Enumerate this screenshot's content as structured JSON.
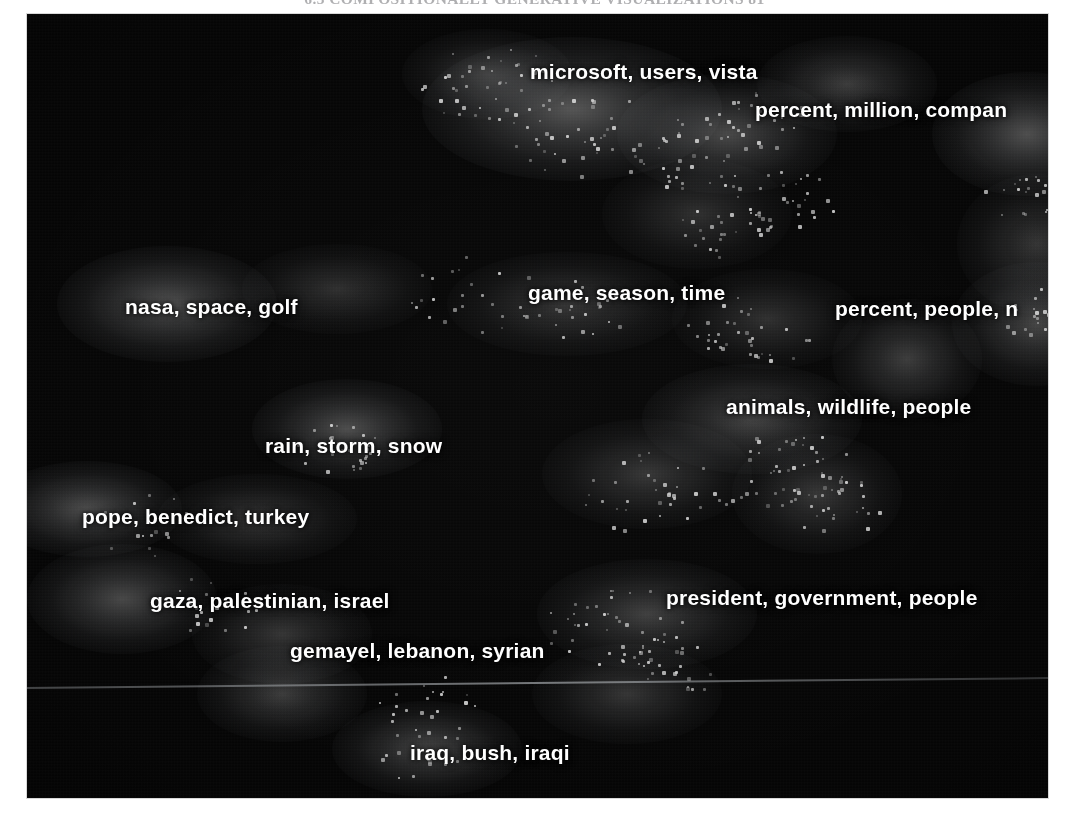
{
  "page": {
    "running_head": "6.3  COMPOSITIONALLY GENERATIVE VISUALIZATIONS     81"
  },
  "figure": {
    "name": "topic-density-map",
    "background_color": "#050505",
    "label_color": "#ffffff",
    "point_color": "#cfcfcf"
  },
  "chart_data": {
    "type": "scatter",
    "title": "",
    "xlabel": "",
    "ylabel": "",
    "grid": false,
    "legend": "none",
    "background": "#050505",
    "xlim": [
      0,
      1021
    ],
    "ylim": [
      0,
      784
    ],
    "labels": [
      {
        "text": "microsoft, users, vista",
        "x": 503,
        "y": 46,
        "align": "left"
      },
      {
        "text": "percent, million, compan",
        "x": 728,
        "y": 84,
        "align": "left",
        "clipped": true
      },
      {
        "text": "nasa, space, golf",
        "x": 98,
        "y": 281,
        "align": "left"
      },
      {
        "text": "game, season, time",
        "x": 501,
        "y": 267,
        "align": "left"
      },
      {
        "text": "percent, people, n",
        "x": 808,
        "y": 283,
        "align": "left",
        "clipped": true
      },
      {
        "text": "animals, wildlife, people",
        "x": 699,
        "y": 381,
        "align": "left"
      },
      {
        "text": "rain, storm, snow",
        "x": 238,
        "y": 420,
        "align": "left"
      },
      {
        "text": "pope, benedict, turkey",
        "x": 55,
        "y": 491,
        "align": "left"
      },
      {
        "text": "gaza, palestinian, israel",
        "x": 123,
        "y": 575,
        "align": "left"
      },
      {
        "text": "president, government, people",
        "x": 639,
        "y": 572,
        "align": "left"
      },
      {
        "text": "gemayel, lebanon, syrian",
        "x": 263,
        "y": 625,
        "align": "left"
      },
      {
        "text": "iraq, bush, iraqi",
        "x": 383,
        "y": 727,
        "align": "left"
      }
    ],
    "density_blobs": [
      {
        "cx": 545,
        "cy": 95,
        "rx": 150,
        "ry": 72,
        "intensity": 0.5
      },
      {
        "cx": 700,
        "cy": 120,
        "rx": 110,
        "ry": 60,
        "intensity": 0.42
      },
      {
        "cx": 820,
        "cy": 70,
        "rx": 90,
        "ry": 48,
        "intensity": 0.34
      },
      {
        "cx": 1000,
        "cy": 120,
        "rx": 95,
        "ry": 62,
        "intensity": 0.46
      },
      {
        "cx": 460,
        "cy": 60,
        "rx": 85,
        "ry": 45,
        "intensity": 0.3
      },
      {
        "cx": 670,
        "cy": 200,
        "rx": 95,
        "ry": 55,
        "intensity": 0.26
      },
      {
        "cx": 1010,
        "cy": 230,
        "rx": 80,
        "ry": 70,
        "intensity": 0.3
      },
      {
        "cx": 140,
        "cy": 290,
        "rx": 110,
        "ry": 58,
        "intensity": 0.46
      },
      {
        "cx": 310,
        "cy": 275,
        "rx": 95,
        "ry": 45,
        "intensity": 0.26
      },
      {
        "cx": 540,
        "cy": 290,
        "rx": 120,
        "ry": 52,
        "intensity": 0.3
      },
      {
        "cx": 740,
        "cy": 305,
        "rx": 95,
        "ry": 50,
        "intensity": 0.26
      },
      {
        "cx": 880,
        "cy": 345,
        "rx": 75,
        "ry": 60,
        "intensity": 0.34
      },
      {
        "cx": 1010,
        "cy": 310,
        "rx": 85,
        "ry": 62,
        "intensity": 0.4
      },
      {
        "cx": 320,
        "cy": 415,
        "rx": 95,
        "ry": 50,
        "intensity": 0.44
      },
      {
        "cx": 725,
        "cy": 405,
        "rx": 110,
        "ry": 55,
        "intensity": 0.38
      },
      {
        "cx": 620,
        "cy": 460,
        "rx": 105,
        "ry": 55,
        "intensity": 0.3
      },
      {
        "cx": 790,
        "cy": 480,
        "rx": 85,
        "ry": 60,
        "intensity": 0.3
      },
      {
        "cx": 60,
        "cy": 495,
        "rx": 95,
        "ry": 48,
        "intensity": 0.44
      },
      {
        "cx": 230,
        "cy": 505,
        "rx": 100,
        "ry": 45,
        "intensity": 0.3
      },
      {
        "cx": 95,
        "cy": 585,
        "rx": 95,
        "ry": 55,
        "intensity": 0.42
      },
      {
        "cx": 255,
        "cy": 620,
        "rx": 90,
        "ry": 50,
        "intensity": 0.3
      },
      {
        "cx": 620,
        "cy": 600,
        "rx": 110,
        "ry": 55,
        "intensity": 0.36
      },
      {
        "cx": 255,
        "cy": 680,
        "rx": 85,
        "ry": 48,
        "intensity": 0.34
      },
      {
        "cx": 600,
        "cy": 680,
        "rx": 95,
        "ry": 50,
        "intensity": 0.3
      },
      {
        "cx": 400,
        "cy": 735,
        "rx": 95,
        "ry": 48,
        "intensity": 0.4
      }
    ],
    "point_clusters": [
      {
        "cx": 460,
        "cy": 70,
        "n": 46,
        "spread": 58
      },
      {
        "cx": 560,
        "cy": 120,
        "n": 40,
        "spread": 62
      },
      {
        "cx": 670,
        "cy": 140,
        "n": 34,
        "spread": 52
      },
      {
        "cx": 730,
        "cy": 105,
        "n": 26,
        "spread": 40
      },
      {
        "cx": 760,
        "cy": 185,
        "n": 30,
        "spread": 46
      },
      {
        "cx": 695,
        "cy": 215,
        "n": 24,
        "spread": 40
      },
      {
        "cx": 718,
        "cy": 320,
        "n": 34,
        "spread": 52
      },
      {
        "cx": 760,
        "cy": 455,
        "n": 38,
        "spread": 54
      },
      {
        "cx": 805,
        "cy": 490,
        "n": 30,
        "spread": 44
      },
      {
        "cx": 450,
        "cy": 280,
        "n": 26,
        "spread": 54
      },
      {
        "cx": 540,
        "cy": 300,
        "n": 22,
        "spread": 48
      },
      {
        "cx": 630,
        "cy": 480,
        "n": 36,
        "spread": 60
      },
      {
        "cx": 585,
        "cy": 610,
        "n": 40,
        "spread": 58
      },
      {
        "cx": 640,
        "cy": 655,
        "n": 26,
        "spread": 40
      },
      {
        "cx": 310,
        "cy": 430,
        "n": 28,
        "spread": 40
      },
      {
        "cx": 185,
        "cy": 590,
        "n": 20,
        "spread": 42
      },
      {
        "cx": 120,
        "cy": 510,
        "n": 16,
        "spread": 44
      },
      {
        "cx": 405,
        "cy": 690,
        "n": 20,
        "spread": 46
      },
      {
        "cx": 400,
        "cy": 740,
        "n": 16,
        "spread": 40
      },
      {
        "cx": 1010,
        "cy": 300,
        "n": 26,
        "spread": 38
      },
      {
        "cx": 1000,
        "cy": 180,
        "n": 22,
        "spread": 36
      }
    ]
  }
}
